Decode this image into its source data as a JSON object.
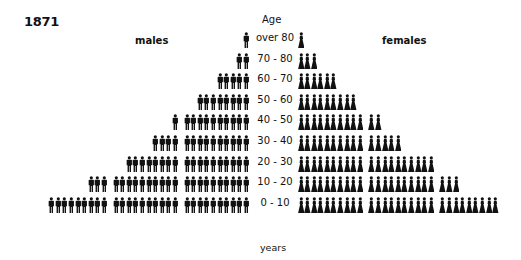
{
  "title": "1871",
  "labels": {
    "males": "males",
    "females": "females",
    "age_header": "Age",
    "age_footer": "years"
  },
  "colors": {
    "figure": "#111111",
    "background": "#ffffff"
  },
  "icons": {
    "male": "male-figure-icon",
    "female": "female-figure-icon"
  },
  "rows": [
    {
      "age": "over 80",
      "males": 1,
      "females": 1
    },
    {
      "age": "70 - 80",
      "males": 2,
      "females": 3
    },
    {
      "age": "60 - 70",
      "males": 5,
      "females": 6
    },
    {
      "age": "50 - 60",
      "males": 8,
      "females": 9
    },
    {
      "age": "40 - 50",
      "males": 11,
      "females": 12
    },
    {
      "age": "30 - 40",
      "males": 14,
      "females": 15
    },
    {
      "age": "20 - 30",
      "males": 18,
      "females": 20
    },
    {
      "age": "10 - 20",
      "males": 23,
      "females": 23
    },
    {
      "age": "0 - 10",
      "males": 29,
      "females": 29
    }
  ],
  "chart_data": {
    "type": "bar",
    "subtype": "pictograph population pyramid",
    "title": "1871",
    "xlabel": "",
    "ylabel": "Age (years)",
    "categories": [
      "over 80",
      "70-80",
      "60-70",
      "50-60",
      "40-50",
      "30-40",
      "20-30",
      "10-20",
      "0-10"
    ],
    "series": [
      {
        "name": "males",
        "values": [
          1,
          2,
          5,
          8,
          11,
          14,
          18,
          23,
          29
        ]
      },
      {
        "name": "females",
        "values": [
          1,
          3,
          6,
          9,
          12,
          15,
          20,
          23,
          29
        ]
      }
    ],
    "unit": "figures (icons grouped in tens)",
    "legend": [
      "males",
      "females"
    ],
    "legend_position": "top",
    "grid": false
  }
}
